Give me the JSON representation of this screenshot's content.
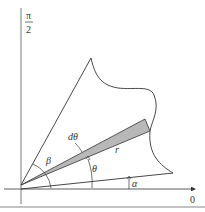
{
  "diagram": {
    "axes": {
      "vertical_label_numerator": "π",
      "vertical_label_denominator": "2",
      "horizontal_label": "0"
    },
    "labels": {
      "d_theta": "dθ",
      "r": "r",
      "beta": "β",
      "theta": "θ",
      "alpha": "α"
    },
    "colors": {
      "stroke": "#333333",
      "wedge_fill": "#b8b8b8",
      "border": "#888888"
    }
  }
}
